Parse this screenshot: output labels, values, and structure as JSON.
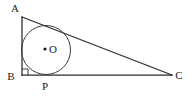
{
  "figure": {
    "background_color": "#ffffff",
    "stroke_color": "#2b2b2b",
    "label_color": "#1a1a1a",
    "vertices": {
      "A": {
        "label": "A",
        "x": 22,
        "y": 17,
        "label_x": 15,
        "label_y": 12
      },
      "B": {
        "label": "B",
        "x": 22,
        "y": 75,
        "label_x": 8,
        "label_y": 80
      },
      "C": {
        "label": "C",
        "x": 172,
        "y": 75,
        "label_x": 176,
        "label_y": 79
      }
    },
    "circle": {
      "center_label": "O",
      "center_x": 46,
      "center_y": 50,
      "radius": 24.5,
      "center_dot_radius": 1.6,
      "center_label_x": 49,
      "center_label_y": 54
    },
    "tangent_point": {
      "label": "P",
      "x": 46,
      "y": 75,
      "label_x": 42,
      "label_y": 90
    },
    "right_angle": {
      "at_vertex": "B",
      "size": 6
    },
    "segments": [
      {
        "name": "AB",
        "from": "A",
        "to": "B"
      },
      {
        "name": "BC",
        "from": "B",
        "to": "C"
      },
      {
        "name": "AC",
        "from": "A",
        "to": "C"
      }
    ]
  }
}
